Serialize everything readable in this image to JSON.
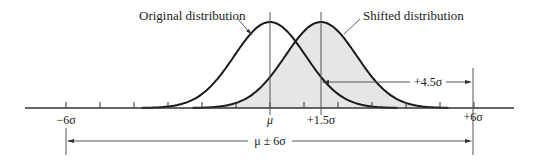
{
  "labels": {
    "original": "Original distribution",
    "shifted": "Shifted distribution",
    "minus6": "−6σ",
    "mu": "μ",
    "plus15": "+1.5σ",
    "plus6": "+6σ",
    "plus45": "+4.5σ",
    "range": "μ ± 6σ"
  },
  "colors": {
    "curve": "#1a1a1a",
    "fill": "#e6e6e6",
    "axis": "#333333",
    "guide": "#555555"
  },
  "axis": {
    "sigma_px": 34,
    "mu_x": 270,
    "baseline_y": 108,
    "ticks_sigma": [
      -6,
      -5,
      -4,
      -3,
      -2,
      -1,
      0,
      1,
      2,
      3,
      4,
      5,
      6
    ]
  }
}
